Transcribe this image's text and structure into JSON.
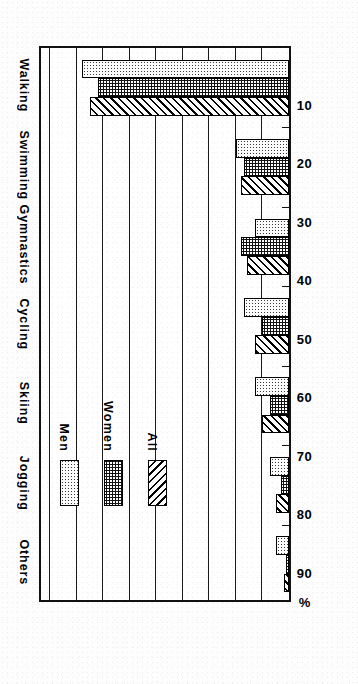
{
  "chart_data": {
    "type": "bar",
    "title": "",
    "subtitle": "",
    "orientation": "rotated-90-ccw",
    "categories": [
      "Walking",
      "Swimming",
      "Gymnastics",
      "Cycling",
      "Skiing",
      "Jogging",
      "Others"
    ],
    "series": [
      {
        "name": "Men",
        "values": [
          78,
          20,
          13,
          17,
          13,
          7,
          5
        ],
        "fill": "light-stipple"
      },
      {
        "name": "Women",
        "values": [
          72,
          17,
          18,
          10,
          7,
          3,
          1
        ],
        "fill": "dark-stipple"
      },
      {
        "name": "All",
        "values": [
          75,
          18,
          16,
          13,
          10,
          5,
          2
        ],
        "fill": "diagonal-hatch"
      }
    ],
    "value_axis_label": "%",
    "value_ticks": [
      10,
      20,
      30,
      40,
      50,
      60,
      70,
      80,
      90
    ],
    "ylim": [
      0,
      95
    ],
    "xlabel": "",
    "ylabel": "%",
    "grid": true,
    "legend_position": "inside-upper-right",
    "legend_entries": [
      "Men",
      "Women",
      "All"
    ],
    "colors": {
      "ink": "#000000",
      "paper": "#ffffff",
      "men": "#ffffff",
      "women": "#ffffff",
      "all": "#ffffff"
    }
  },
  "legend": {
    "items": [
      {
        "label": "Men"
      },
      {
        "label": "Women"
      },
      {
        "label": "All"
      }
    ]
  },
  "axis": {
    "percent_symbol": "%",
    "ticks": [
      "90",
      "80",
      "70",
      "60",
      "50",
      "40",
      "30",
      "20",
      "10"
    ]
  },
  "categories": [
    {
      "label": "Walking"
    },
    {
      "label": "Swimming"
    },
    {
      "label": "Gymnastics"
    },
    {
      "label": "Cycling"
    },
    {
      "label": "Skiing"
    },
    {
      "label": "Jogging"
    },
    {
      "label": "Others"
    }
  ]
}
